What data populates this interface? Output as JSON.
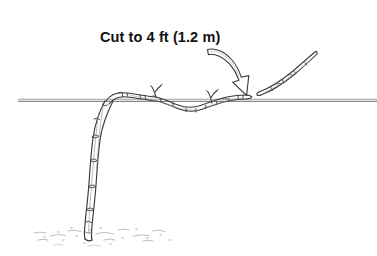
{
  "figure": {
    "background_color": "#ffffff",
    "ink_color": "#2b2b2b",
    "wire_color": "#8c8c8c",
    "soil_color": "#b9b9b9",
    "width": 377,
    "height": 256
  },
  "caption": {
    "label": "Cut to 4 ft (1.2 m)",
    "x": 100,
    "y": 42,
    "font_size_px": 14.5,
    "font_weight": "bold",
    "color": "#111111"
  },
  "annotation_arrow": {
    "name": "curved-arrow",
    "style": "hollow-outline-curved",
    "description": "Curved outline arrow sweeping from upper left down to lower right, tip pointing at the cut location on the cane",
    "tail_x": 208,
    "tail_y": 50,
    "tip_x": 247,
    "tip_y": 94,
    "outline_color": "#3a3a3a",
    "fill_color": "#ffffff"
  },
  "trellis_wire": {
    "name": "horizontal-trellis-wire",
    "y": 100,
    "x_start": 18,
    "x_end": 377,
    "color": "#8c8c8c",
    "line_count": 2
  },
  "main_cane": {
    "name": "trained-horizontal-cane",
    "description": "Woody cane trained along the trellis wire, dipping below it in a shallow loop, with nodes and upward Y-shaped shoots",
    "node_count": 12,
    "shoots": [
      {
        "name": "y-shoot-left",
        "x": 155,
        "y": 88
      },
      {
        "name": "y-shoot-right",
        "x": 211,
        "y": 88
      }
    ]
  },
  "trunk": {
    "name": "vine-trunk",
    "description": "Vertical trunk curving from the wire junction down to the soil line",
    "top_x": 108,
    "top_y": 100,
    "base_x": 88,
    "base_y": 238,
    "node_count": 6
  },
  "removed_cane": {
    "name": "severed-cane-piece",
    "description": "Cut-off portion of cane lying detached above and to the right of the cut point, angling up to the right",
    "start_x": 258,
    "start_y": 92,
    "end_x": 315,
    "end_y": 52
  },
  "soil": {
    "name": "soil-line",
    "description": "Stippled ground surface with scattered dashes and dots around the base of the trunk",
    "y": 235,
    "x_start": 32,
    "x_end": 178
  }
}
